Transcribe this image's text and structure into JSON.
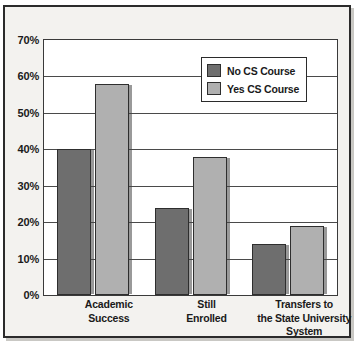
{
  "chart_data": {
    "type": "bar",
    "title": "",
    "subtitle": "",
    "xlabel": "",
    "ylabel": "",
    "categories": [
      "Academic\nSuccess",
      "Still\nEnrolled",
      "Transfers to\nthe State University\nSystem"
    ],
    "series": [
      {
        "name": "No CS Course",
        "values": [
          40,
          24,
          14
        ],
        "color": "#6e6e6e"
      },
      {
        "name": "Yes CS Course",
        "values": [
          58,
          38,
          19
        ],
        "color": "#b0b0b0"
      }
    ],
    "ylim": [
      0,
      70
    ],
    "ytick_values": [
      0,
      10,
      20,
      30,
      40,
      50,
      60,
      70
    ],
    "ytick_labels": [
      "0%",
      "10%",
      "20%",
      "30%",
      "40%",
      "50%",
      "60%",
      "70%"
    ],
    "grid": true,
    "legend_position": "top-right",
    "value_suffix": "%"
  },
  "legend": {
    "entries": [
      {
        "label": "No CS Course"
      },
      {
        "label": "Yes CS Course"
      }
    ]
  },
  "colors": {
    "series_no_cs": "#6e6e6e",
    "series_yes_cs": "#b0b0b0",
    "frame_border": "#2b2b2b",
    "page_background": "#f3f2ef",
    "plot_background": "#ffffff",
    "gridline": "#4a4a4a",
    "text": "#1a1a1a"
  }
}
